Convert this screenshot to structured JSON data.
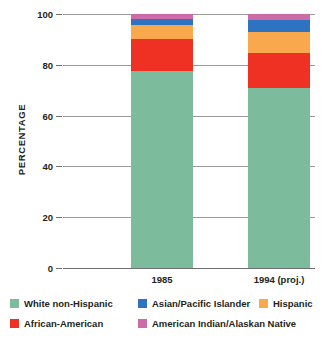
{
  "chart_data": {
    "type": "bar",
    "subtype": "stacked-100-percent",
    "title": "",
    "xlabel": "",
    "ylabel": "PERCENTAGE",
    "ylim": [
      0,
      100
    ],
    "yticks": [
      0,
      20,
      40,
      60,
      80,
      100
    ],
    "ytick_labels": [
      "0",
      "20",
      "40",
      "60",
      "80",
      "100"
    ],
    "grid": true,
    "legend_position": "bottom",
    "categories": [
      "1985",
      "1994 (proj.)"
    ],
    "series": [
      {
        "name": "White non-Hispanic",
        "color": "#7cbb9c",
        "values": [
          77.5,
          71.0
        ]
      },
      {
        "name": "African-American",
        "color": "#ef3124",
        "values": [
          12.5,
          13.5
        ]
      },
      {
        "name": "Hispanic",
        "color": "#f9a84e",
        "values": [
          5.5,
          8.5
        ]
      },
      {
        "name": "Asian/Pacific Islander",
        "color": "#2d73bf",
        "values": [
          2.5,
          4.5
        ]
      },
      {
        "name": "American Indian/Alaskan Native",
        "color": "#cc6ba8",
        "values": [
          2.0,
          2.5
        ]
      }
    ]
  },
  "axis": {
    "y_title": "PERCENTAGE",
    "ticks": [
      {
        "label": "100",
        "value": 100
      },
      {
        "label": "80",
        "value": 80
      },
      {
        "label": "60",
        "value": 60
      },
      {
        "label": "40",
        "value": 40
      },
      {
        "label": "20",
        "value": 20
      },
      {
        "label": "0",
        "value": 0
      }
    ]
  },
  "bars": [
    {
      "category": "1985",
      "segments": [
        {
          "name": "American Indian/Alaskan Native",
          "color": "#cc6ba8",
          "value": 2.0,
          "cumulative_top": 100.0
        },
        {
          "name": "Asian/Pacific Islander",
          "color": "#2d73bf",
          "value": 2.5,
          "cumulative_top": 98.0
        },
        {
          "name": "Hispanic",
          "color": "#f9a84e",
          "value": 5.5,
          "cumulative_top": 95.5
        },
        {
          "name": "African-American",
          "color": "#ef3124",
          "value": 12.5,
          "cumulative_top": 90.0
        },
        {
          "name": "White non-Hispanic",
          "color": "#7cbb9c",
          "value": 77.5,
          "cumulative_top": 77.5
        }
      ]
    },
    {
      "category": "1994 (proj.)",
      "segments": [
        {
          "name": "American Indian/Alaskan Native",
          "color": "#cc6ba8",
          "value": 2.5,
          "cumulative_top": 100.0
        },
        {
          "name": "Asian/Pacific Islander",
          "color": "#2d73bf",
          "value": 4.5,
          "cumulative_top": 97.5
        },
        {
          "name": "Hispanic",
          "color": "#f9a84e",
          "value": 8.5,
          "cumulative_top": 93.0
        },
        {
          "name": "African-American",
          "color": "#ef3124",
          "value": 13.5,
          "cumulative_top": 84.5
        },
        {
          "name": "White non-Hispanic",
          "color": "#7cbb9c",
          "value": 71.0,
          "cumulative_top": 71.0
        }
      ]
    }
  ],
  "legend": {
    "rows": [
      [
        {
          "label": "White non-Hispanic",
          "color": "#7cbb9c",
          "left": 0
        },
        {
          "label": "Asian/Pacific Islander",
          "color": "#2d73bf",
          "left": 128
        },
        {
          "label": "Hispanic",
          "color": "#f9a84e",
          "left": 249
        }
      ],
      [
        {
          "label": "African-American",
          "color": "#ef3124",
          "left": 0
        },
        {
          "label": "American Indian/Alaskan Native",
          "color": "#cc6ba8",
          "left": 128
        }
      ]
    ]
  }
}
